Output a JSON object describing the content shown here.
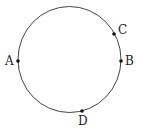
{
  "diagram": {
    "type": "circle-with-points",
    "circle": {
      "cx": 69.5,
      "cy": 59.5,
      "rx": 51.5,
      "ry": 53,
      "stroke": "#444444"
    },
    "points": [
      {
        "id": "A",
        "label": "A",
        "x": 18,
        "y": 61,
        "lx": 5,
        "ly": 65
      },
      {
        "id": "B",
        "label": "B",
        "x": 121,
        "y": 61,
        "lx": 125,
        "ly": 65
      },
      {
        "id": "C",
        "label": "C",
        "x": 114,
        "y": 34,
        "lx": 118,
        "ly": 34
      },
      {
        "id": "D",
        "label": "D",
        "x": 82,
        "y": 111,
        "lx": 78,
        "ly": 125
      }
    ],
    "point_color": "#111111"
  }
}
